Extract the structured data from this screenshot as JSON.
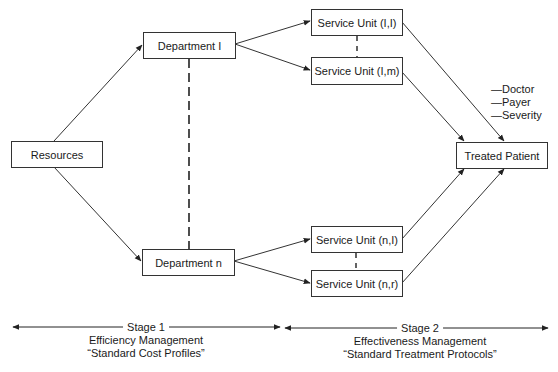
{
  "diagram": {
    "nodes": {
      "resources": "Resources",
      "department_1": "Department I",
      "department_n": "Department n",
      "service_unit_1_1": "Service Unit (I,I)",
      "service_unit_1_m": "Service Unit (I,m)",
      "service_unit_n_1": "Service Unit (n,I)",
      "service_unit_n_r": "Service Unit (n,r)",
      "treated_patient": "Treated Patient"
    },
    "patient_factors": [
      "—Doctor",
      "—Payer",
      "—Severity"
    ],
    "stages": [
      {
        "label": "Stage 1",
        "title": "Efficiency Management",
        "subtitle": "“Standard Cost Profiles”"
      },
      {
        "label": "Stage 2",
        "title": "Effectiveness Management",
        "subtitle": "“Standard Treatment Protocols”"
      }
    ],
    "edges": [
      [
        "resources",
        "department_1"
      ],
      [
        "resources",
        "department_n"
      ],
      [
        "department_1",
        "service_unit_1_1"
      ],
      [
        "department_1",
        "service_unit_1_m"
      ],
      [
        "department_n",
        "service_unit_n_1"
      ],
      [
        "department_n",
        "service_unit_n_r"
      ],
      [
        "service_unit_1_1",
        "treated_patient"
      ],
      [
        "service_unit_1_m",
        "treated_patient"
      ],
      [
        "service_unit_n_1",
        "treated_patient"
      ],
      [
        "service_unit_n_r",
        "treated_patient"
      ]
    ],
    "dashed_links": [
      [
        "department_1",
        "department_n"
      ],
      [
        "service_unit_1_1",
        "service_unit_1_m"
      ],
      [
        "service_unit_n_1",
        "service_unit_n_r"
      ]
    ],
    "colors": {
      "line": "#333333",
      "text": "#1a1a1a",
      "background": "#ffffff"
    }
  }
}
